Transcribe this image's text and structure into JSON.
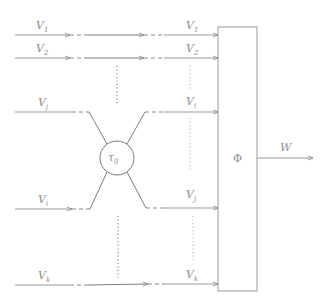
{
  "diagram": {
    "inputs": [
      {
        "name": "V",
        "sub": "1"
      },
      {
        "name": "V",
        "sub": "2"
      },
      {
        "name": "V",
        "sub": "j"
      },
      {
        "name": "V",
        "sub": "i"
      },
      {
        "name": "V",
        "sub": "k"
      }
    ],
    "outputs": [
      {
        "name": "V",
        "sub": "1"
      },
      {
        "name": "V",
        "sub": "2"
      },
      {
        "name": "V",
        "sub": "i"
      },
      {
        "name": "V",
        "sub": "j"
      },
      {
        "name": "V",
        "sub": "k"
      }
    ],
    "swap_node": {
      "symbol": "τ",
      "sub": "ij"
    },
    "aggregator": {
      "symbol": "Φ"
    },
    "output": {
      "name": "W"
    }
  }
}
